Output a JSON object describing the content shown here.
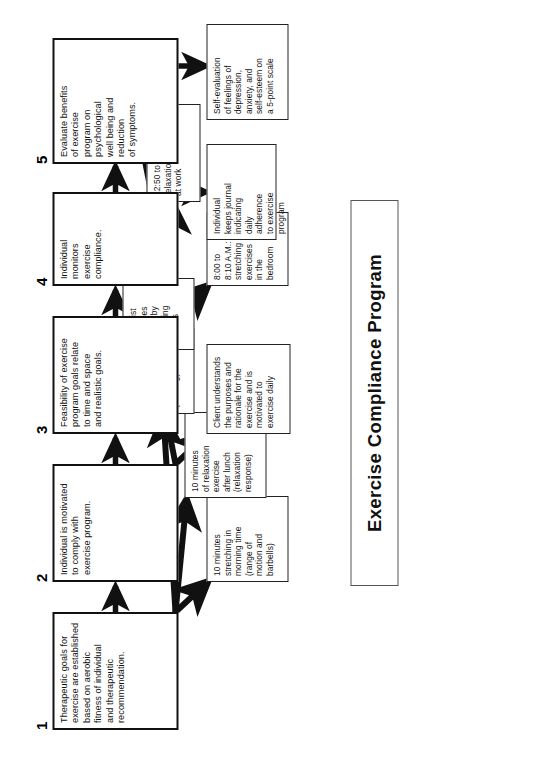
{
  "title": {
    "text": "Exercise Compliance Program"
  },
  "steps": [
    {
      "number": "1",
      "main": "Therapeutic goals for\nexercise are established\nbased on aerobic\nfitness of individual\nand therapeutic\nrecommendation.",
      "subs": [
        "10 minutes\nstretching in\nmorning time\n(range of\nmotion and\nbarbells)",
        "10 minutes\nof relaxation\nexercise\nafter lunch\n(relaxation\nresponse)",
        "30 minutes\nof aerobics\nbefore dinner\n(walking)"
      ]
    },
    {
      "number": "2",
      "main": "Individual is motivated\nto comply with\nexercise program.",
      "subs": [
        "Client understands\nthe purposes and\nrationale for the\nexercise and is\nmotivated to\nexercise daily",
        "Therapist\nreinforces\nactivity by\nexplaining\nbenefits"
      ]
    },
    {
      "number": "3",
      "main": "Feasibility of exercise\nprogram goals relate\nto time and space\nand realistic goals.",
      "subs": [
        "8:00 to\n8:10 A.M.:\nstretching\nexercises\nin the\nbedroom",
        "12:50 to 1:00 P.M.:\nrelaxation at desk\nat work",
        "5:30 to\n6:00 P.M.:\naerobic\nexercise\nby walking\naround\nneighborhood"
      ]
    },
    {
      "number": "4",
      "main": "Individual\nmonitors\nexercise\ncompliance.",
      "subs": [
        "Individual\nkeeps journal\nindicating\ndaily\nadherence\nto exercise\nprogram"
      ]
    },
    {
      "number": "5",
      "main": "Evaluate benefits\nof exercise\nprogram on\npsychological\nwell being and\nreduction\nof symptoms.",
      "subs": [
        "Self-evaluation\nof feelings of\ndepression,\nanxiety, and\nself-esteem on\na 5-point scale"
      ]
    }
  ],
  "colors": {
    "line": "#111111",
    "box_border": "#222222",
    "background": "#ffffff"
  }
}
